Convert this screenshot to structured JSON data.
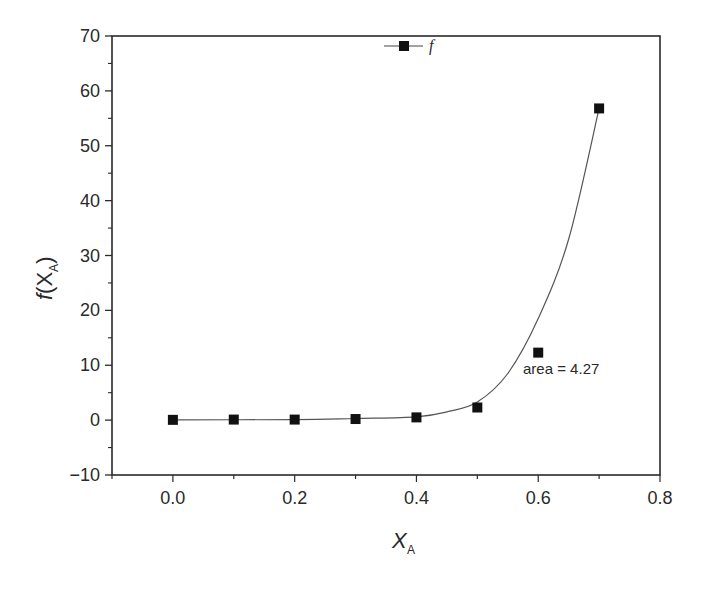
{
  "chart_data": {
    "type": "scatter",
    "title": "",
    "xlabel": "X_A",
    "ylabel": "f(X_A)",
    "xlim": [
      -0.1,
      0.8
    ],
    "ylim": [
      -10,
      70
    ],
    "grid": false,
    "legend_position": "top-center",
    "x_ticks": [
      "0.0",
      "0.2",
      "0.4",
      "0.6",
      "0.8"
    ],
    "y_ticks": [
      "-10",
      "0",
      "10",
      "20",
      "30",
      "40",
      "50",
      "60",
      "70"
    ],
    "series": [
      {
        "name": "f",
        "marker": "filled-square",
        "x": [
          0.0,
          0.1,
          0.2,
          0.3,
          0.4,
          0.5,
          0.6,
          0.7
        ],
        "values": [
          0.05,
          0.1,
          0.1,
          0.2,
          0.5,
          2.3,
          12.3,
          56.8
        ]
      },
      {
        "name": "fit curve",
        "style": "line",
        "x": [
          0.0,
          0.2,
          0.3,
          0.4,
          0.45,
          0.5,
          0.55,
          0.6,
          0.65,
          0.7
        ],
        "values": [
          0.05,
          0.1,
          0.3,
          0.6,
          1.5,
          3.3,
          8.5,
          18.5,
          33,
          56.8
        ]
      }
    ],
    "annotations": [
      "area = 4.27"
    ]
  },
  "labels": {
    "xlabel_main": "X",
    "xlabel_sub": "A",
    "ylabel_pre": "f",
    "ylabel_main": "(X",
    "ylabel_sub": "A",
    "ylabel_post": ")",
    "legend": "f",
    "annotation": "area = 4.27"
  },
  "colors": {
    "axis": "#2a2a2a",
    "marker": "#111111",
    "curve": "#555555"
  }
}
